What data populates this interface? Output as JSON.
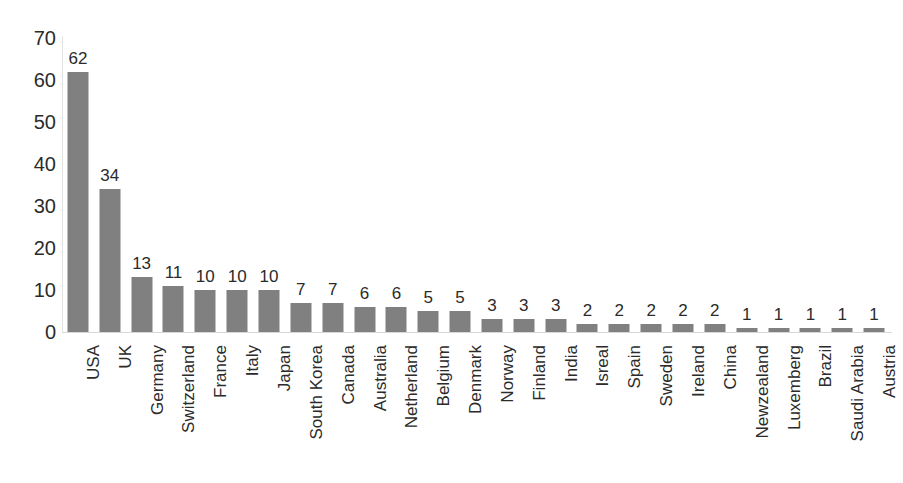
{
  "chart_data": {
    "type": "bar",
    "title": "",
    "subtitle": "",
    "xlabel": "",
    "ylabel": "",
    "ylim": [
      0,
      70
    ],
    "y_ticks": [
      0,
      10,
      20,
      30,
      40,
      50,
      60,
      70
    ],
    "grid": false,
    "legend": null,
    "bar_color": "#808080",
    "background_color": "#ffffff",
    "value_labels_shown": true,
    "category_label_rotation": "vertical-bottom-up",
    "categories": [
      "USA",
      "UK",
      "Germany",
      "Switzerland",
      "France",
      "Italy",
      "Japan",
      "South Korea",
      "Canada",
      "Australia",
      "Netherland",
      "Belgium",
      "Denmark",
      "Norway",
      "Finland",
      "India",
      "Isreal",
      "Spain",
      "Sweden",
      "Ireland",
      "China",
      "Newzealand",
      "Luxemberg",
      "Brazil",
      "Saudi Arabia",
      "Austria"
    ],
    "values": [
      62,
      34,
      13,
      11,
      10,
      10,
      10,
      7,
      7,
      6,
      6,
      5,
      5,
      3,
      3,
      3,
      2,
      2,
      2,
      2,
      2,
      1,
      1,
      1,
      1,
      1
    ]
  }
}
